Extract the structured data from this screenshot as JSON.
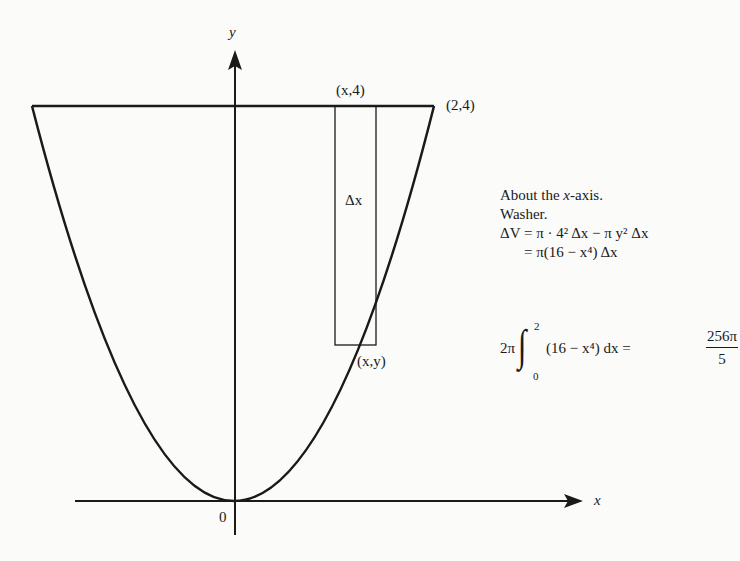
{
  "diagram": {
    "axes": {
      "x_label": "x",
      "y_label": "y",
      "origin_label": "0"
    },
    "curve": "y = x^2",
    "points": {
      "top_strip": "(x,4)",
      "corner": "(2,4)",
      "curve_point": "(x,y)"
    },
    "strip_label": "Δx"
  },
  "notes": {
    "line1_pre": "About the ",
    "line1_var": "x",
    "line1_post": "-axis.",
    "line2": "Washer.",
    "line3": "ΔV = π · 4² Δx − π y² Δx",
    "line4": "= π(16 − x⁴) Δx"
  },
  "integral": {
    "coefficient": "2π",
    "upper": "2",
    "lower": "0",
    "integrand": "(16 − x⁴) dx =",
    "result_numerator": "256π",
    "result_denominator": "5"
  }
}
